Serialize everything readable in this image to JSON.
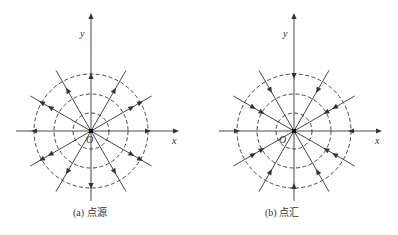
{
  "panels": [
    {
      "id": "a",
      "caption": "(a) 点源",
      "type": "source",
      "x_label": "x",
      "y_label": "y",
      "origin_label": "O",
      "arrow_direction": "outward"
    },
    {
      "id": "b",
      "caption": "(b) 点汇",
      "type": "sink",
      "x_label": "x",
      "y_label": "y",
      "origin_label": "O",
      "arrow_direction": "inward"
    }
  ],
  "geometry": {
    "circle_radii": [
      18,
      37,
      57
    ],
    "ray_angles_deg": [
      0,
      30,
      60,
      90,
      120,
      150,
      180,
      210,
      240,
      270,
      300,
      330
    ],
    "line_color": "#333333"
  }
}
